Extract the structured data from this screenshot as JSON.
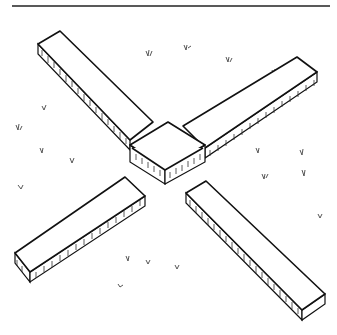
{
  "illustration": {
    "subject": "isometric line drawing of a square central block with four rectangular planks radiating diagonally on grass",
    "stroke_color": "#111111",
    "background_color": "#ffffff",
    "components": [
      "top-rule",
      "center-block",
      "plank-nw",
      "plank-ne",
      "plank-sw",
      "plank-se",
      "grass-tufts"
    ]
  }
}
